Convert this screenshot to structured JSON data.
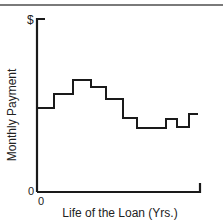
{
  "chart_data": {
    "type": "line",
    "step": true,
    "title": "",
    "xlabel": "Life of the Loan (Yrs.)",
    "ylabel": "Monthly Payment",
    "y_top_tick_label": "$",
    "y_zero_tick_label": "0",
    "x_zero_tick_label": "0",
    "grid": false,
    "legend": null,
    "units": "relative (schematic, no numeric scale shown)",
    "xlim": [
      0,
      1
    ],
    "ylim": [
      0,
      1
    ],
    "x": [
      0.0,
      0.104,
      0.221,
      0.331,
      0.423,
      0.528,
      0.613,
      0.791,
      0.859,
      0.933,
      0.988
    ],
    "values": [
      0.486,
      0.566,
      0.647,
      0.607,
      0.538,
      0.428,
      0.37,
      0.422,
      0.376,
      0.451,
      0.451
    ],
    "pixel_path": [
      [
        37,
        108
      ],
      [
        54,
        108
      ],
      [
        54,
        94
      ],
      [
        73,
        94
      ],
      [
        73,
        80
      ],
      [
        91,
        80
      ],
      [
        91,
        87
      ],
      [
        106,
        87
      ],
      [
        106,
        99
      ],
      [
        123,
        99
      ],
      [
        123,
        118
      ],
      [
        137,
        118
      ],
      [
        137,
        128
      ],
      [
        166,
        128
      ],
      [
        166,
        119
      ],
      [
        177,
        119
      ],
      [
        177,
        127
      ],
      [
        189,
        127
      ],
      [
        189,
        114
      ],
      [
        198,
        114
      ]
    ],
    "axis": {
      "origin": [
        37,
        192
      ],
      "y_top": 19,
      "x_right": 200,
      "y_top_tick_right": 45,
      "x_right_tick_top": 183
    },
    "colors": {
      "line": "#1a1a1a",
      "axis": "#1a1a1a",
      "top_rule": "#7a7a7a"
    }
  }
}
